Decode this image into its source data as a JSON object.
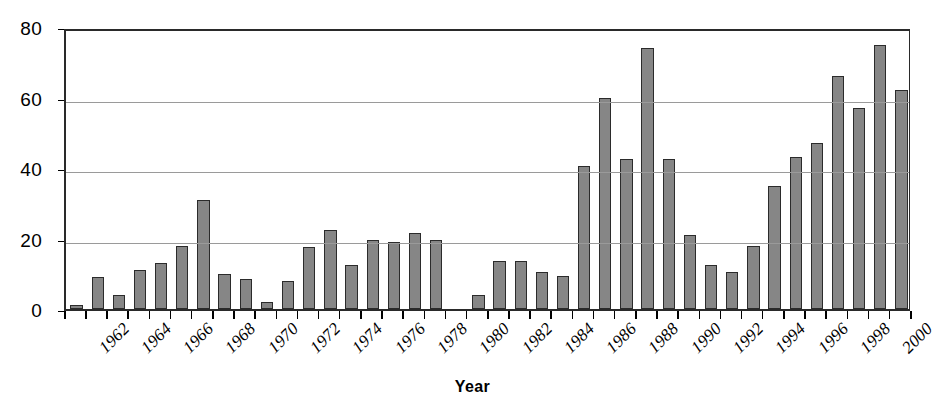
{
  "chart_data": {
    "type": "bar",
    "title": "",
    "xlabel": "Year",
    "ylabel": "",
    "ylim": [
      0,
      80
    ],
    "y_ticks": [
      0,
      20,
      40,
      60,
      80
    ],
    "grid": true,
    "legend": "none",
    "bar_color": "#868686",
    "bar_edge_color": "#2b2b2b",
    "gridline_color": "#9a9a9a",
    "axis_color": "#2a2a2a",
    "x_tick_label_rotation": -45,
    "x_tick_label_step": 2,
    "categories": [
      "1962",
      "1963",
      "1964",
      "1965",
      "1966",
      "1967",
      "1968",
      "1969",
      "1970",
      "1971",
      "1972",
      "1973",
      "1974",
      "1975",
      "1976",
      "1977",
      "1978",
      "1979",
      "1980",
      "1981",
      "1982",
      "1983",
      "1984",
      "1985",
      "1986",
      "1987",
      "1988",
      "1989",
      "1990",
      "1991",
      "1992",
      "1993",
      "1994",
      "1995",
      "1996",
      "1997",
      "1998",
      "1999",
      "2000",
      "2001"
    ],
    "values": [
      1,
      9,
      4,
      11,
      13,
      18,
      31,
      10,
      8.5,
      2,
      8,
      17.5,
      22.5,
      12.5,
      19.5,
      19,
      21.5,
      19.5,
      0,
      4,
      13.5,
      13.5,
      10.5,
      9.5,
      40.5,
      60,
      42.5,
      74,
      42.5,
      21,
      12.5,
      10.5,
      18,
      35,
      43,
      47,
      66,
      57,
      75,
      62
    ],
    "visible_x_tick_labels": [
      "1962",
      "1964",
      "1966",
      "1968",
      "1970",
      "1972",
      "1974",
      "1976",
      "1978",
      "1980",
      "1982",
      "1984",
      "1986",
      "1988",
      "1990",
      "1992",
      "1994",
      "1996",
      "1998",
      "2000"
    ],
    "trailing_value_note": 34
  },
  "axis": {
    "x_title": "Year"
  }
}
